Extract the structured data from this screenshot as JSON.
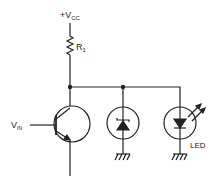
{
  "diagram": {
    "type": "circuit-schematic",
    "labels": {
      "supply": "+V",
      "supply_sub": "CC",
      "resistor": "R",
      "resistor_sub": "1",
      "input": "V",
      "input_sub": "IN",
      "led": "LED"
    },
    "components": [
      {
        "id": "R1",
        "kind": "resistor",
        "label": "R1"
      },
      {
        "id": "Q1",
        "kind": "npn-transistor",
        "input": "VIN"
      },
      {
        "id": "D1",
        "kind": "zener-diode"
      },
      {
        "id": "D2",
        "kind": "led",
        "label": "LED"
      }
    ],
    "colors": {
      "line": "#222222",
      "background": "#ffffff"
    }
  }
}
